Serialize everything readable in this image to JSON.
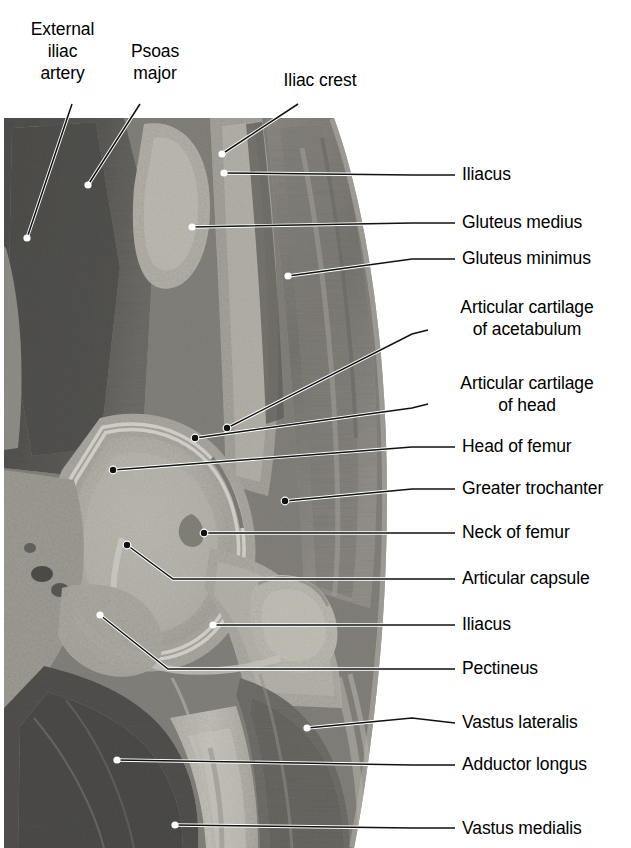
{
  "figure": {
    "kind": "anatomical-photograph",
    "width": 631,
    "height": 848,
    "photo": {
      "x": 4,
      "y": 118,
      "width": 398,
      "height": 730
    }
  },
  "colors": {
    "background": "#ffffff",
    "text": "#000000",
    "leader_dark": "#000000",
    "leader_light": "#ffffff",
    "tissue_dark": "#1d1d1d",
    "tissue_mid": "#6e6c68",
    "tissue_light": "#c9c5bd",
    "bone_light": "#d8d4cb",
    "cartilage": "#efece4"
  },
  "labels": {
    "top": [
      {
        "id": "external-iliac-artery",
        "text": "External\niliac\nartery",
        "lines": [
          "External",
          "iliac",
          "artery"
        ],
        "x": 10,
        "y": 18,
        "width": 105,
        "align": "center",
        "leader": {
          "x1": 72,
          "y1": 104,
          "x2": 27,
          "y2": 238
        }
      },
      {
        "id": "psoas-major",
        "text": "Psoas\nmajor",
        "lines": [
          "Psoas",
          "major"
        ],
        "x": 110,
        "y": 40,
        "width": 90,
        "align": "center",
        "leader": {
          "x1": 140,
          "y1": 104,
          "x2": 88,
          "y2": 185
        }
      },
      {
        "id": "iliac-crest",
        "text": "Iliac crest",
        "lines": [
          "Iliac crest"
        ],
        "x": 272,
        "y": 70,
        "width": 96,
        "align": "center",
        "leader": {
          "x1": 298,
          "y1": 104,
          "x2": 222,
          "y2": 154
        }
      }
    ],
    "right": [
      {
        "id": "iliacus-upper",
        "text": "Iliacus",
        "lines": [
          "Iliacus"
        ],
        "x": 462,
        "y": 164,
        "leader": {
          "points": "455,175 412,175 224,173"
        }
      },
      {
        "id": "gluteus-medius",
        "text": "Gluteus medius",
        "lines": [
          "Gluteus medius"
        ],
        "x": 462,
        "y": 212,
        "leader": {
          "points": "455,223 412,223 192,227"
        }
      },
      {
        "id": "gluteus-minimus",
        "text": "Gluteus minimus",
        "lines": [
          "Gluteus minimus"
        ],
        "x": 462,
        "y": 248,
        "leader": {
          "points": "455,259 412,259 288,276"
        }
      },
      {
        "id": "articular-cartilage-of-acetabulum",
        "text": "Articular cartilage\nof acetabulum",
        "lines": [
          "Articular cartilage",
          "of acetabulum"
        ],
        "x": 434,
        "y": 296,
        "width": 186,
        "align": "center",
        "leader": {
          "points": "428,330 412,334 227,428"
        }
      },
      {
        "id": "articular-cartilage-of-head",
        "text": "Articular cartilage\nof head",
        "lines": [
          "Articular cartilage",
          "of head"
        ],
        "x": 434,
        "y": 372,
        "width": 186,
        "align": "center",
        "leader": {
          "points": "428,404 412,408 195,438"
        }
      },
      {
        "id": "head-of-femur",
        "text": "Head of femur",
        "lines": [
          "Head of femur"
        ],
        "x": 462,
        "y": 436,
        "leader": {
          "points": "455,447 412,447 113,470"
        }
      },
      {
        "id": "greater-trochanter",
        "text": "Greater trochanter",
        "lines": [
          "Greater trochanter"
        ],
        "x": 462,
        "y": 478,
        "leader": {
          "points": "455,489 412,489 285,501"
        }
      },
      {
        "id": "neck-of-femur",
        "text": "Neck of femur",
        "lines": [
          "Neck of femur"
        ],
        "x": 462,
        "y": 522,
        "leader": {
          "points": "455,533 412,533 204,533"
        }
      },
      {
        "id": "articular-capsule",
        "text": "Articular capsule",
        "lines": [
          "Articular capsule"
        ],
        "x": 462,
        "y": 568,
        "leader": {
          "points": "455,579 412,579 173,579 127,545"
        }
      },
      {
        "id": "iliacus-lower",
        "text": "Iliacus",
        "lines": [
          "Iliacus"
        ],
        "x": 462,
        "y": 614,
        "leader": {
          "points": "455,625 412,625 213,625"
        }
      },
      {
        "id": "pectineus",
        "text": "Pectineus",
        "lines": [
          "Pectineus"
        ],
        "x": 462,
        "y": 658,
        "leader": {
          "points": "455,669 412,669 168,669 100,615"
        }
      },
      {
        "id": "vastus-lateralis",
        "text": "Vastus lateralis",
        "lines": [
          "Vastus lateralis"
        ],
        "x": 462,
        "y": 712,
        "leader": {
          "points": "455,723 412,718 307,728"
        }
      },
      {
        "id": "adductor-longus",
        "text": "Adductor longus",
        "lines": [
          "Adductor longus"
        ],
        "x": 462,
        "y": 754,
        "leader": {
          "points": "455,765 412,765 117,760"
        }
      },
      {
        "id": "vastus-medialis",
        "text": "Vastus medialis",
        "lines": [
          "Vastus medialis"
        ],
        "x": 462,
        "y": 818,
        "leader": {
          "points": "455,828 412,828 175,825"
        }
      }
    ]
  }
}
